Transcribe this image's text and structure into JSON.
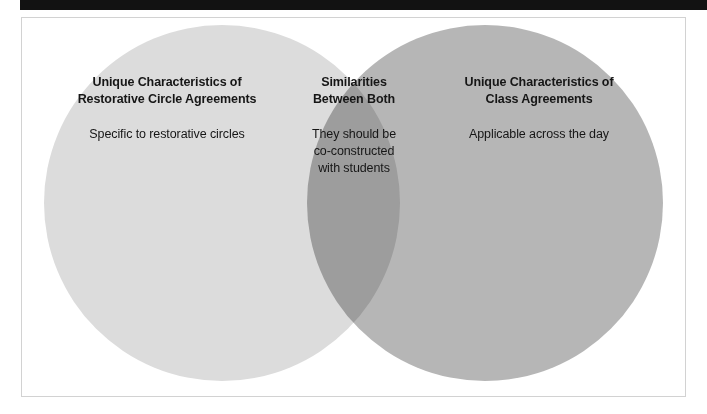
{
  "page": {
    "background_color": "#ffffff",
    "top_bar_color": "#121212",
    "frame_border_color": "#d2d2d2"
  },
  "diagram": {
    "type": "venn",
    "set_count": 2,
    "left_circle": {
      "fill_color": "#dcdcdc",
      "heading_lines": [
        "Unique Characteristics of",
        "Restorative Circle Agreements"
      ],
      "body_lines": [
        "Specific to restorative circles"
      ]
    },
    "overlap": {
      "fill_color": "#9e9e9e",
      "heading_lines": [
        "Similarities",
        "Between Both"
      ],
      "body_lines": [
        "They should be",
        "co-constructed",
        "with students"
      ]
    },
    "right_circle": {
      "fill_color": "#b6b6b6",
      "heading_lines": [
        "Unique Characteristics of",
        "Class Agreements"
      ],
      "body_lines": [
        "Applicable across the day"
      ]
    }
  }
}
